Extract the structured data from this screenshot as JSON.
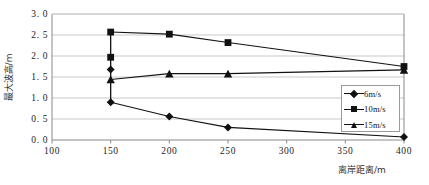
{
  "chart_data": {
    "type": "line",
    "title": "",
    "xlabel": "离岸距离/m",
    "ylabel": "最大波高/m",
    "xlim": [
      100,
      400
    ],
    "ylim": [
      0.0,
      3.0
    ],
    "xticks": [
      100,
      150,
      200,
      250,
      300,
      350,
      400
    ],
    "xtick_labels": [
      "100",
      "150",
      "200",
      "250",
      "300",
      "350",
      "400"
    ],
    "yticks": [
      0.0,
      0.5,
      1.0,
      1.5,
      2.0,
      2.5,
      3.0
    ],
    "ytick_labels": [
      "0. 0",
      "0. 5",
      "1. 0",
      "1. 5",
      "2. 0",
      "2. 5",
      "3. 0"
    ],
    "grid": "horizontal",
    "legend_position": "center-right",
    "series": [
      {
        "name": "6m/s",
        "marker": "diamond",
        "x": [
          150,
          200,
          250,
          400
        ],
        "values": [
          0.9,
          0.56,
          0.3,
          0.07
        ]
      },
      {
        "name": "10m/s",
        "marker": "square",
        "x": [
          150,
          200,
          250,
          400
        ],
        "values": [
          2.57,
          2.52,
          2.32,
          1.75
        ]
      },
      {
        "name": "15m/s",
        "marker": "triangle",
        "x": [
          150,
          200,
          250,
          400
        ],
        "values": [
          1.44,
          1.58,
          1.58,
          1.67
        ]
      }
    ],
    "extra_markers_at_150": [
      {
        "series": "10m/s",
        "value": 1.97,
        "marker": "square"
      },
      {
        "series": "6m/s",
        "value": 1.68,
        "marker": "diamond"
      }
    ],
    "annotations": []
  },
  "legend": {
    "items": [
      {
        "label": "6m/s",
        "marker": "diamond"
      },
      {
        "label": "10m/s",
        "marker": "square"
      },
      {
        "label": "15m/s",
        "marker": "triangle"
      }
    ]
  },
  "axes": {
    "y_title": "最大波高/m",
    "x_title": "离岸距离/m"
  },
  "colors": {
    "line": "#111111",
    "grid": "#c9c9c9",
    "axis": "#8a8a8a",
    "text": "#222222"
  }
}
